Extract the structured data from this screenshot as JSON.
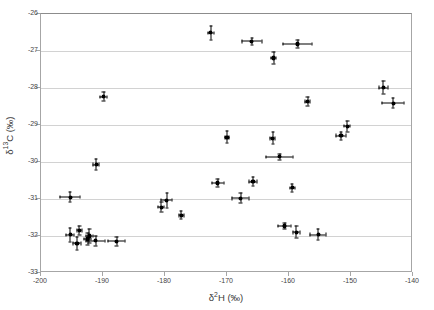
{
  "chart_data": {
    "type": "scatter",
    "title": "",
    "xlabel": "δ²H (‰)",
    "ylabel": "δ¹³C (‰)",
    "xlabel_parts": {
      "delta": "δ",
      "sup": "2",
      "rest": "H (‰)"
    },
    "ylabel_parts": {
      "delta": "δ",
      "sup": "13",
      "rest": "C (‰)"
    },
    "xlim": [
      -200,
      -140
    ],
    "ylim": [
      -33,
      -26
    ],
    "xticks": [
      -200,
      -190,
      -180,
      -170,
      -160,
      -150,
      -140
    ],
    "yticks": [
      -26,
      -27,
      -28,
      -29,
      -30,
      -31,
      -32,
      -33
    ],
    "xticklabels": [
      "-200",
      "-190",
      "-180",
      "-170",
      "-160",
      "-150",
      "-140"
    ],
    "yticklabels": [
      "-26",
      "-27",
      "-28",
      "-29",
      "-30",
      "-31",
      "-32",
      "-33"
    ],
    "grid": "horizontal",
    "grid_color": "#d2d2d2",
    "marker_color": "#000000",
    "legend": "none",
    "points": [
      {
        "x": -172.6,
        "y": -26.51,
        "xerr": 0.5,
        "yerr": 0.18
      },
      {
        "x": -166.0,
        "y": -26.74,
        "xerr": 1.6,
        "yerr": 0.09
      },
      {
        "x": -158.6,
        "y": -26.81,
        "xerr": 2.3,
        "yerr": 0.11
      },
      {
        "x": -162.5,
        "y": -27.19,
        "xerr": 0.4,
        "yerr": 0.15
      },
      {
        "x": -144.8,
        "y": -27.99,
        "xerr": 0.7,
        "yerr": 0.18
      },
      {
        "x": -189.9,
        "y": -28.24,
        "xerr": 0.6,
        "yerr": 0.12
      },
      {
        "x": -157.0,
        "y": -28.37,
        "xerr": 0.4,
        "yerr": 0.12
      },
      {
        "x": -143.2,
        "y": -28.41,
        "xerr": 1.8,
        "yerr": 0.14
      },
      {
        "x": -150.6,
        "y": -29.03,
        "xerr": 0.5,
        "yerr": 0.15
      },
      {
        "x": -151.6,
        "y": -29.29,
        "xerr": 0.8,
        "yerr": 0.11
      },
      {
        "x": -170.0,
        "y": -29.33,
        "xerr": 0.4,
        "yerr": 0.16
      },
      {
        "x": -162.6,
        "y": -29.36,
        "xerr": 0.4,
        "yerr": 0.16
      },
      {
        "x": -161.5,
        "y": -29.86,
        "xerr": 2.2,
        "yerr": 0.08
      },
      {
        "x": -191.1,
        "y": -30.07,
        "xerr": 0.5,
        "yerr": 0.15
      },
      {
        "x": -165.8,
        "y": -30.53,
        "xerr": 0.7,
        "yerr": 0.12
      },
      {
        "x": -171.5,
        "y": -30.57,
        "xerr": 1.0,
        "yerr": 0.11
      },
      {
        "x": -159.5,
        "y": -30.7,
        "xerr": 0.4,
        "yerr": 0.11
      },
      {
        "x": -195.3,
        "y": -30.95,
        "xerr": 1.6,
        "yerr": 0.14
      },
      {
        "x": -167.8,
        "y": -30.98,
        "xerr": 1.4,
        "yerr": 0.13
      },
      {
        "x": -179.7,
        "y": -31.03,
        "xerr": 0.9,
        "yerr": 0.2
      },
      {
        "x": -180.6,
        "y": -31.22,
        "xerr": 0.5,
        "yerr": 0.14
      },
      {
        "x": -177.4,
        "y": -31.44,
        "xerr": 0.4,
        "yerr": 0.11
      },
      {
        "x": -160.7,
        "y": -31.73,
        "xerr": 1.1,
        "yerr": 0.09
      },
      {
        "x": -193.8,
        "y": -31.85,
        "xerr": 0.4,
        "yerr": 0.13
      },
      {
        "x": -158.8,
        "y": -31.9,
        "xerr": 0.6,
        "yerr": 0.16
      },
      {
        "x": -155.3,
        "y": -31.96,
        "xerr": 1.3,
        "yerr": 0.14
      },
      {
        "x": -195.3,
        "y": -31.97,
        "xerr": 0.6,
        "yerr": 0.19
      },
      {
        "x": -192.2,
        "y": -32.0,
        "xerr": 0.6,
        "yerr": 0.2
      },
      {
        "x": -192.5,
        "y": -32.08,
        "xerr": 0.5,
        "yerr": 0.15
      },
      {
        "x": -191.2,
        "y": -32.13,
        "xerr": 1.5,
        "yerr": 0.13
      },
      {
        "x": -187.8,
        "y": -32.14,
        "xerr": 1.4,
        "yerr": 0.12
      },
      {
        "x": -194.2,
        "y": -32.2,
        "xerr": 0.7,
        "yerr": 0.17
      }
    ]
  }
}
